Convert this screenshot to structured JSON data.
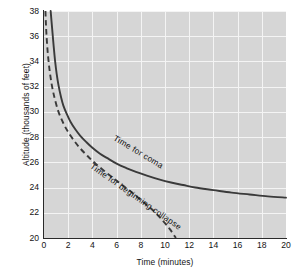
{
  "chart_data": {
    "type": "line",
    "title": "",
    "xlabel": "Time (minutes)",
    "ylabel": "Altitude (thousands of feet)",
    "xlim": [
      0,
      20
    ],
    "ylim": [
      20,
      38
    ],
    "xticks": [
      0,
      2,
      4,
      6,
      8,
      10,
      12,
      14,
      16,
      18,
      20
    ],
    "yticks": [
      20,
      22,
      24,
      26,
      28,
      30,
      32,
      34,
      36,
      38
    ],
    "grid": true,
    "legend_position": "inline-annotations",
    "plot_background": "#d6d6d6",
    "gridline_color": "#f4f4f4",
    "curve_color": "#3a3a3a",
    "series": [
      {
        "name": "Time for coma",
        "style": "solid",
        "annotation": "Time for coma",
        "x": [
          0.55,
          0.62,
          0.7,
          0.8,
          0.92,
          1.05,
          1.2,
          1.4,
          1.6,
          1.9,
          2.2,
          2.6,
          3.0,
          3.5,
          4.0,
          4.6,
          5.2,
          6.0,
          6.8,
          7.6,
          8.5,
          9.5,
          10.5,
          11.5,
          12.5,
          14.0,
          15.5,
          17.0,
          18.5,
          20.0
        ],
        "y": [
          38.0,
          37.2,
          36.3,
          35.2,
          34.0,
          33.0,
          32.1,
          31.2,
          30.5,
          29.8,
          29.2,
          28.6,
          28.1,
          27.6,
          27.15,
          26.7,
          26.35,
          25.9,
          25.55,
          25.25,
          24.95,
          24.65,
          24.4,
          24.2,
          24.0,
          23.8,
          23.6,
          23.45,
          23.3,
          23.2
        ]
      },
      {
        "name": "Time for beginning collapse",
        "style": "dashed",
        "annotation": "Time for beginning collapse",
        "x": [
          0.12,
          0.15,
          0.2,
          0.3,
          0.45,
          0.65,
          0.9,
          1.2,
          1.6,
          2.0,
          2.5,
          3.0,
          3.6,
          4.2,
          5.0,
          5.8,
          6.6,
          7.4,
          8.2,
          9.0,
          9.8,
          10.4,
          10.9
        ],
        "y": [
          38.0,
          37.2,
          36.2,
          34.8,
          33.4,
          32.1,
          31.0,
          30.0,
          29.1,
          28.4,
          27.7,
          27.1,
          26.5,
          25.95,
          25.3,
          24.7,
          24.1,
          23.5,
          22.85,
          22.2,
          21.4,
          20.7,
          20.0
        ]
      }
    ]
  }
}
